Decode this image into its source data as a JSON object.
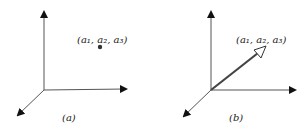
{
  "panels": [
    {
      "id": "a",
      "caption": "(a)",
      "point_label": "(a₁, a₂, a₃)",
      "representation": "point"
    },
    {
      "id": "b",
      "caption": "(b)",
      "point_label": "(a₁, a₂, a₃)",
      "representation": "vector"
    }
  ],
  "colors": {
    "axis": "#555555",
    "arrowhead": "#111111",
    "vector": "#444444",
    "point": "#333333",
    "text": "#222222"
  }
}
